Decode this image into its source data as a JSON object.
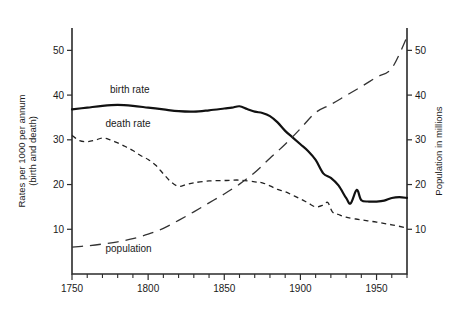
{
  "chart_data": {
    "type": "line",
    "title": "",
    "subtitle": "",
    "xlabel": "",
    "ylabel": "Rates per 1000 per annum (birth and death)",
    "y2label": "Population in millions",
    "xlim": [
      1750,
      1970
    ],
    "ylim": [
      0,
      55
    ],
    "y2lim": [
      0,
      55
    ],
    "grid": false,
    "legend_position": "inline-annotations",
    "xticks": [
      1750,
      1800,
      1850,
      1900,
      1950
    ],
    "xticklabels": [
      "1750",
      "1800",
      "1850",
      "1900",
      "1950"
    ],
    "xminorticks": [
      1760,
      1770,
      1780,
      1790,
      1810,
      1820,
      1830,
      1840,
      1860,
      1870,
      1880,
      1890,
      1910,
      1920,
      1930,
      1940,
      1960,
      1970
    ],
    "yticks": [
      10,
      20,
      30,
      40,
      50
    ],
    "yticklabels": [
      "10",
      "20",
      "30",
      "40",
      "50"
    ],
    "y2ticks": [
      10,
      20,
      30,
      40,
      50
    ],
    "y2ticklabels": [
      "10",
      "20",
      "30",
      "40",
      "50"
    ],
    "series": [
      {
        "name": "birth rate",
        "label": "birth rate",
        "style": "solid-thick",
        "axis": "left",
        "x": [
          1750,
          1760,
          1770,
          1780,
          1790,
          1800,
          1810,
          1820,
          1830,
          1840,
          1850,
          1855,
          1860,
          1865,
          1870,
          1875,
          1880,
          1885,
          1890,
          1895,
          1900,
          1905,
          1910,
          1915,
          1920,
          1925,
          1930,
          1933,
          1937,
          1940,
          1945,
          1950,
          1955,
          1960,
          1965,
          1970
        ],
        "y": [
          36.8,
          37.2,
          37.6,
          37.8,
          37.6,
          37.2,
          36.8,
          36.4,
          36.3,
          36.6,
          37.0,
          37.2,
          37.5,
          36.9,
          36.3,
          36.0,
          35.3,
          33.9,
          32.0,
          30.5,
          29.0,
          27.5,
          25.5,
          22.5,
          21.5,
          19.8,
          17.0,
          15.8,
          18.8,
          16.5,
          16.2,
          16.2,
          16.4,
          17.0,
          17.2,
          17.0
        ]
      },
      {
        "name": "death rate",
        "label": "death rate",
        "style": "short-dashed",
        "axis": "left",
        "x": [
          1750,
          1755,
          1760,
          1765,
          1770,
          1775,
          1780,
          1785,
          1790,
          1795,
          1800,
          1805,
          1810,
          1815,
          1820,
          1825,
          1830,
          1840,
          1850,
          1860,
          1870,
          1875,
          1880,
          1885,
          1890,
          1895,
          1900,
          1905,
          1910,
          1915,
          1918,
          1921,
          1925,
          1930,
          1940,
          1950,
          1960,
          1970
        ],
        "y": [
          31.0,
          29.8,
          29.6,
          29.9,
          30.4,
          30.0,
          29.3,
          28.5,
          27.6,
          26.5,
          25.6,
          24.3,
          22.4,
          20.6,
          19.6,
          20.0,
          20.4,
          20.8,
          20.9,
          21.0,
          20.6,
          20.4,
          19.7,
          18.9,
          18.4,
          17.6,
          16.8,
          15.9,
          15.0,
          15.4,
          16.0,
          13.9,
          13.3,
          12.7,
          12.1,
          11.6,
          11.0,
          10.3
        ]
      },
      {
        "name": "population",
        "label": "population",
        "style": "long-dashed",
        "axis": "right",
        "x": [
          1750,
          1760,
          1770,
          1780,
          1790,
          1800,
          1810,
          1820,
          1830,
          1840,
          1850,
          1860,
          1870,
          1880,
          1890,
          1900,
          1910,
          1920,
          1930,
          1940,
          1950,
          1960,
          1970
        ],
        "y": [
          6.0,
          6.3,
          6.7,
          7.2,
          7.9,
          8.9,
          10.2,
          12.0,
          13.9,
          15.9,
          17.9,
          20.1,
          22.7,
          25.9,
          29.0,
          32.5,
          36.1,
          37.9,
          39.9,
          41.9,
          44.0,
          46.0,
          53.0
        ]
      }
    ],
    "annotations": [
      {
        "text": "birth rate",
        "x": 1775,
        "y": 40.5
      },
      {
        "text": "death rate",
        "x": 1772,
        "y": 32.8
      },
      {
        "text": "population",
        "x": 1772,
        "y": 5.0
      }
    ]
  }
}
